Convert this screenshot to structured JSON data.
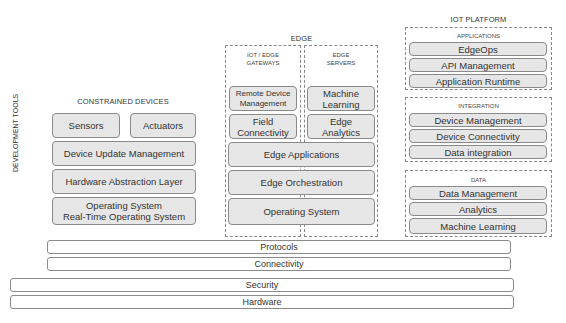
{
  "side_label": "DEVELOPMENT TOOLS",
  "constrained": {
    "title": "CONSTRAINED DEVICES",
    "sensors": "Sensors",
    "actuators": "Actuators",
    "device_update": "Device Update Management",
    "hal": "Hardware Abstraction Layer",
    "os_line1": "Operating System",
    "os_line2": "Real-Time Operating System"
  },
  "edge": {
    "title": "EDGE",
    "gateways_title_1": "IOT / EDGE",
    "gateways_title_2": "GATEWAYS",
    "servers_title_1": "EDGE",
    "servers_title_2": "SERVERS",
    "remote_1": "Remote Device",
    "remote_2": "Management",
    "field_1": "Field",
    "field_2": "Connectivity",
    "ml_1": "Machine",
    "ml_2": "Learning",
    "analytics_1": "Edge",
    "analytics_2": "Analytics",
    "applications": "Edge Applications",
    "orchestration": "Edge Orchestration",
    "os": "Operating System"
  },
  "platform": {
    "title": "IOT PLATFORM",
    "applications": {
      "title": "APPLICATIONS",
      "items": [
        "EdgeOps",
        "API Management",
        "Application Runtime"
      ]
    },
    "integration": {
      "title": "INTEGRATION",
      "items": [
        "Device Management",
        "Device Connectivity",
        "Data integration"
      ]
    },
    "data": {
      "title": "DATA",
      "items": [
        "Data Management",
        "Analytics",
        "Machine Learning"
      ]
    }
  },
  "layers": {
    "protocols": "Protocols",
    "connectivity": "Connectivity",
    "security": "Security",
    "hardware": "Hardware"
  }
}
